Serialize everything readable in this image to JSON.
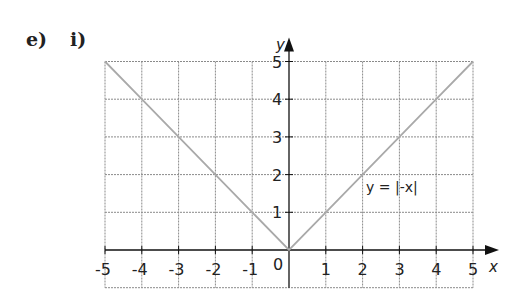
{
  "question": {
    "part_label": "e)",
    "subpart_label": "i)"
  },
  "chart_data": {
    "type": "line",
    "title": "",
    "xlabel": "x",
    "ylabel": "y",
    "xlim": [
      -5,
      5
    ],
    "ylim": [
      -1,
      5
    ],
    "grid": true,
    "x_ticks": [
      -5,
      -4,
      -3,
      -2,
      -1,
      0,
      1,
      2,
      3,
      4,
      5
    ],
    "x_tick_labels": [
      "-5",
      "-4",
      "-3",
      "-2",
      "-1",
      "0",
      "1",
      "2",
      "3",
      "4",
      "5"
    ],
    "y_ticks": [
      1,
      2,
      3,
      4,
      5
    ],
    "y_tick_labels": [
      "1",
      "2",
      "3",
      "4",
      "5"
    ],
    "series": [
      {
        "name": "y = |-x|",
        "x": [
          -5,
          -4,
          -3,
          -2,
          -1,
          0,
          1,
          2,
          3,
          4,
          5
        ],
        "y": [
          5,
          4,
          3,
          2,
          1,
          0,
          1,
          2,
          3,
          4,
          5
        ],
        "color": "#a9a9a9"
      }
    ],
    "annotations": [
      {
        "text": "y = |-x|",
        "x": 2.1,
        "y": 1.65
      }
    ],
    "colors": {
      "grid": "#8a8a8a",
      "axis": "#111111",
      "line": "#a9a9a9"
    }
  }
}
